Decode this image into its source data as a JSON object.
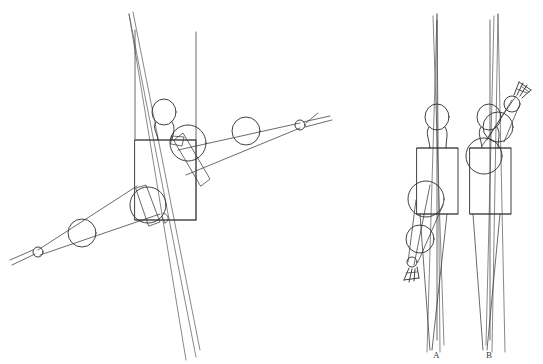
{
  "figure": {
    "background_color": "#ffffff",
    "line_color": "#2b2b2b",
    "faint_line_color": "#555555",
    "media": "line drawing",
    "panel_count": 2
  },
  "labels": {
    "figure_a": "A",
    "figure_b": "B"
  },
  "left_panel": {
    "name": "rotated-figure-study",
    "description": "Mannequin construction figure rotated roughly 90 degrees, with two extended arms built from circle joints and a rectangular torso box.",
    "parts": [
      {
        "name": "head",
        "shape": "oval"
      },
      {
        "name": "neck",
        "shape": "curved-band"
      },
      {
        "name": "torso-box",
        "shape": "rectangle"
      },
      {
        "name": "upper-right-shoulder",
        "shape": "circle"
      },
      {
        "name": "upper-right-elbow",
        "shape": "circle"
      },
      {
        "name": "upper-right-hand",
        "shape": "small-circle"
      },
      {
        "name": "lower-left-shoulder",
        "shape": "circle"
      },
      {
        "name": "lower-left-elbow",
        "shape": "circle"
      },
      {
        "name": "lower-left-hand",
        "shape": "small-circle"
      },
      {
        "name": "construction-axis",
        "shape": "long-line"
      }
    ]
  },
  "right_panel": {
    "name": "standing-figures-study",
    "description": "Two standing mannequin figures seen from the front; figure A has a lowered arm with an open hand, figure B has a raised arm with an open hand.",
    "figures": [
      {
        "label": "A",
        "arm_pose": "lowered",
        "parts": [
          {
            "name": "head",
            "shape": "oval"
          },
          {
            "name": "neck",
            "shape": "curved-band"
          },
          {
            "name": "torso-box",
            "shape": "rectangle"
          },
          {
            "name": "shoulder",
            "shape": "circle"
          },
          {
            "name": "elbow",
            "shape": "circle"
          },
          {
            "name": "wrist",
            "shape": "small-circle"
          },
          {
            "name": "hand",
            "shape": "fingers"
          },
          {
            "name": "construction-axis",
            "shape": "long-line"
          }
        ]
      },
      {
        "label": "B",
        "arm_pose": "raised",
        "parts": [
          {
            "name": "head",
            "shape": "oval"
          },
          {
            "name": "neck",
            "shape": "curved-band"
          },
          {
            "name": "torso-box",
            "shape": "rectangle"
          },
          {
            "name": "shoulder",
            "shape": "circle"
          },
          {
            "name": "elbow",
            "shape": "circle"
          },
          {
            "name": "wrist",
            "shape": "small-circle"
          },
          {
            "name": "hand",
            "shape": "fingers"
          },
          {
            "name": "construction-axis",
            "shape": "long-line"
          }
        ]
      }
    ]
  }
}
